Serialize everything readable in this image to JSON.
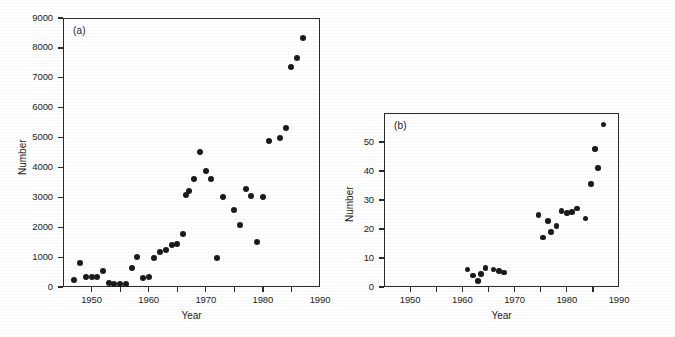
{
  "figure": {
    "panels": [
      {
        "tag": "(a)",
        "xlabel": "Year",
        "ylabel": "Number"
      },
      {
        "tag": "(b)",
        "xlabel": "Year",
        "ylabel": "Number"
      }
    ]
  },
  "chart_data": [
    {
      "type": "scatter",
      "panel": "(a)",
      "title": "",
      "xlabel": "Year",
      "ylabel": "Number",
      "xlim": [
        1945,
        1990
      ],
      "ylim": [
        0,
        9000
      ],
      "xticks": [
        1945,
        1950,
        1955,
        1960,
        1965,
        1970,
        1975,
        1980,
        1985,
        1990
      ],
      "xtick_labels": [
        "",
        "1950",
        "",
        "1960",
        "",
        "1970",
        "",
        "1980",
        "",
        "1990"
      ],
      "yticks": [
        0,
        1000,
        2000,
        3000,
        4000,
        5000,
        6000,
        7000,
        8000,
        9000
      ],
      "ytick_labels": [
        "0",
        "1000",
        "2000",
        "3000",
        "4000",
        "5000",
        "6000",
        "7000",
        "8000",
        "9000"
      ],
      "grid": false,
      "legend": "none",
      "marker": "filled-circle",
      "marker_color": "#1b1b1b",
      "x": [
        1947,
        1948,
        1949,
        1950,
        1951,
        1952,
        1953,
        1954,
        1955,
        1956,
        1957,
        1958,
        1959,
        1960,
        1961,
        1962,
        1963,
        1964,
        1965,
        1966,
        1966.6,
        1967,
        1968,
        1969,
        1970,
        1971,
        1972,
        1973,
        1975,
        1976,
        1977,
        1978,
        1979,
        1980,
        1981,
        1983,
        1984,
        1985,
        1986,
        1987
      ],
      "y": [
        250,
        800,
        350,
        330,
        330,
        550,
        120,
        90,
        100,
        90,
        620,
        1000,
        300,
        320,
        980,
        1180,
        1250,
        1400,
        1450,
        1760,
        3080,
        3200,
        3620,
        4520,
        3880,
        3620,
        980,
        3020,
        2580,
        2080,
        3280,
        3050,
        1520,
        3010,
        4880,
        5000,
        5320,
        7370,
        7670,
        8320,
        8680
      ]
    },
    {
      "type": "scatter",
      "panel": "(b)",
      "title": "",
      "xlabel": "Year",
      "ylabel": "Number",
      "xlim": [
        1945,
        1990
      ],
      "ylim": [
        0,
        60
      ],
      "xticks": [
        1945,
        1950,
        1955,
        1960,
        1965,
        1970,
        1975,
        1980,
        1985,
        1990
      ],
      "xtick_labels": [
        "",
        "1950",
        "",
        "1960",
        "",
        "1970",
        "",
        "1980",
        "",
        "1990"
      ],
      "yticks": [
        0,
        10,
        20,
        30,
        40,
        50
      ],
      "ytick_labels": [
        "0",
        "10",
        "20",
        "30",
        "40",
        "50"
      ],
      "grid": false,
      "legend": "none",
      "marker": "filled-circle",
      "marker_color": "#1b1b1b",
      "x": [
        1961,
        1962,
        1963,
        1963.6,
        1964.4,
        1966,
        1967,
        1968,
        1974.6,
        1975.4,
        1976.4,
        1977,
        1978,
        1979,
        1980,
        1981,
        1982,
        1983.6,
        1984.6,
        1985.4,
        1986,
        1987
      ],
      "y": [
        6,
        4,
        2,
        4.5,
        6.5,
        6,
        5.5,
        5,
        24.8,
        17,
        22.8,
        19,
        21,
        26.2,
        25.5,
        25.8,
        27,
        23.6,
        35.5,
        47.5,
        41,
        56
      ]
    }
  ]
}
